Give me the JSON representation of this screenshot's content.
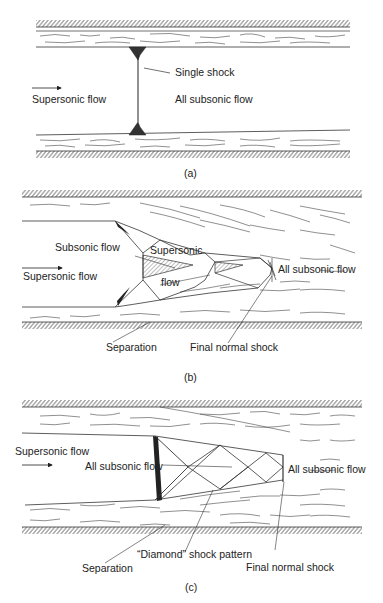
{
  "panels": [
    {
      "caption": "(a)",
      "labels": {
        "inflow": "Supersonic flow",
        "shock": "Single shock",
        "downstream": "All subsonic flow"
      }
    },
    {
      "caption": "(b)",
      "labels": {
        "inflow": "Supersonic flow",
        "subsonic_core": "Subsonic flow",
        "supersonic_core_line1": "Supersonic",
        "supersonic_core_line2": "flow",
        "downstream": "All subsonic flow",
        "separation": "Separation",
        "final_shock": "Final normal shock"
      }
    },
    {
      "caption": "(c)",
      "labels": {
        "inflow": "Supersonic flow",
        "core": "All subsonic flow",
        "downstream": "All subsonic flow",
        "diamond": "“Diamond” shock pattern",
        "separation": "Separation",
        "final_shock": "Final normal shock"
      }
    }
  ]
}
